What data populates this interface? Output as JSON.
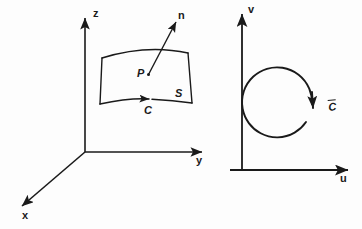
{
  "figure": {
    "background_color": "#fdfdfd",
    "ink_color": "#1a1a1a",
    "width": 362,
    "height": 229
  },
  "left_panel": {
    "name": "xyz-space-diagram",
    "axes": [
      {
        "id": "z",
        "label": "z",
        "direction": "up"
      },
      {
        "id": "y",
        "label": "y",
        "direction": "right"
      },
      {
        "id": "x",
        "label": "x",
        "direction": "down-left"
      }
    ],
    "surface": {
      "label": "S",
      "boundary_label": "C",
      "point_label": "P",
      "normal_label": "n"
    }
  },
  "right_panel": {
    "name": "uv-parameter-plane-diagram",
    "axes": [
      {
        "id": "v",
        "label": "v",
        "direction": "up"
      },
      {
        "id": "u",
        "label": "u",
        "direction": "right"
      }
    ],
    "curve": {
      "label_base": "C",
      "label_accent": "overbar",
      "shape": "circle",
      "orientation": "clockwise-arrow-at-right"
    }
  }
}
